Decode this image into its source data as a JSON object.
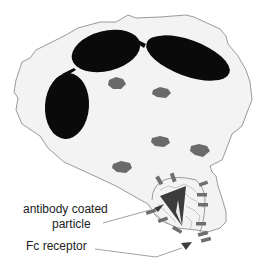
{
  "diagram": {
    "labels": {
      "particle_line1": "antibody coated",
      "particle_line2": "particle",
      "receptor": "Fc receptor"
    },
    "components": {
      "cell": "phagocytic cell (macrophage)",
      "nucleus_lobes": 3,
      "granules": 5,
      "fc_receptors": 12,
      "particle": "antibody coated particle (triangle)"
    },
    "colors": {
      "cell_fill": "#f3f3f3",
      "cell_outline": "#9a9a9a",
      "nucleus": "#0a0a0a",
      "granule": "#6a6a6a",
      "particle": "#3c3c3c",
      "receptor": "#6e6e6e",
      "leader_line": "#8a8a8a"
    }
  }
}
